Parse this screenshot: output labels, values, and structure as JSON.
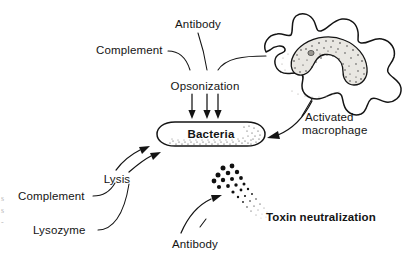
{
  "figure": {
    "background_color": "#ffffff",
    "ink_color": "#141414"
  },
  "labels": {
    "antibody_top": "Antibody",
    "complement_top": "Complement",
    "opsonization": "Opsonization",
    "bacteria": "Bacteria",
    "activated_macrophage_line1": "Activated",
    "activated_macrophage_line2": "macrophage",
    "lysis": "Lysis",
    "complement_bottom": "Complement",
    "lysozyme": "Lysozyme",
    "antibody_bottom": "Antibody",
    "toxin_neutralization": "Toxin neutralization"
  },
  "edge_fragments": {
    "frag1": "s",
    "frag2": "s",
    "frag3": "-"
  },
  "structures": {
    "bacterium": {
      "shape": "rounded-rod-capsule",
      "shading": "stippled-bottom-and-right"
    },
    "macrophage": {
      "shape": "amoeboid-blob",
      "nucleus_shape": "kidney-horseshoe",
      "nucleus_shading": "stippled",
      "nucleolus": "small-dark-spot"
    },
    "toxin_particles": {
      "description": "cluster of dots diminishing in size from upper-left to lower-right",
      "count": 34
    }
  },
  "connections": [
    {
      "from": "Complement",
      "to": "Opsonization",
      "style": "curved-leader"
    },
    {
      "from": "Antibody",
      "to": "Opsonization",
      "style": "straight-leader"
    },
    {
      "from": "Activated macrophage",
      "to": "Opsonization",
      "style": "curved-leader"
    },
    {
      "from": "Opsonization",
      "to": "Bacteria",
      "style": "triple-down-arrow"
    },
    {
      "from": "Activated macrophage",
      "to": "Bacteria",
      "style": "curved-arrow"
    },
    {
      "from": "Lysis",
      "to": "Bacteria",
      "style": "double-curved-arrow"
    },
    {
      "from": "Complement",
      "to": "Lysis",
      "style": "curved-leader"
    },
    {
      "from": "Lysozyme",
      "to": "Lysis",
      "style": "curved-leader"
    },
    {
      "from": "Antibody",
      "to": "Toxin particles",
      "style": "curved-arrow"
    }
  ]
}
